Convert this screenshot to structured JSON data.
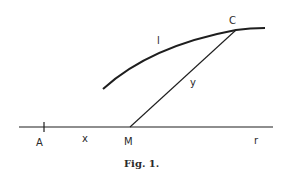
{
  "figure": {
    "caption": "Fig. 1.",
    "line_color": "#1e1e1e",
    "labels": {
      "point_a": "A",
      "segment_x": "x",
      "point_m": "M",
      "axis_r": "r",
      "curve_l": "l",
      "point_c": "C",
      "segment_y": "y"
    }
  }
}
